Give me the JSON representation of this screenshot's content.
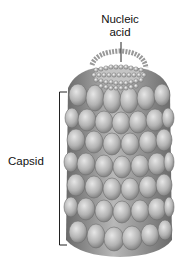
{
  "labels": {
    "nucleic_acid_line1": "Nucleic",
    "nucleic_acid_line2": "acid",
    "capsid": "Capsid"
  },
  "colors": {
    "background": "#ffffff",
    "capsomere_light": "#d9d9d9",
    "capsomere_mid": "#a8a8a8",
    "capsomere_dark": "#6e6e6e",
    "line": "#222222"
  }
}
